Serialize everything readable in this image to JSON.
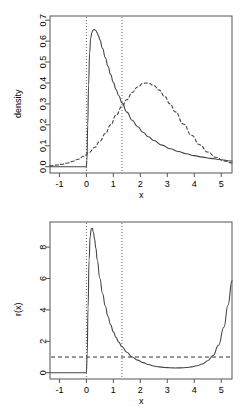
{
  "figure": {
    "type": "multi-panel-plot",
    "background": "#ffffff",
    "foreground": "#000000",
    "panels": 2
  },
  "chart_data": [
    {
      "type": "line",
      "panel": "top",
      "title": "",
      "xlabel": "x",
      "ylabel": "density",
      "xlim": [
        -1.35,
        5.4
      ],
      "ylim": [
        -0.03,
        0.72
      ],
      "xticks": [
        -1,
        0,
        1,
        2,
        3,
        4,
        5
      ],
      "xticklabels": [
        "-1",
        "0",
        "1",
        "2",
        "3",
        "4",
        "5"
      ],
      "yticks": [
        0.0,
        0.1,
        0.2,
        0.3,
        0.4,
        0.5,
        0.6,
        0.7
      ],
      "yticklabels": [
        "0.0",
        "0.1",
        "0.2",
        "0.3",
        "0.4",
        "0.5",
        "0.6",
        "0.7"
      ],
      "grid": false,
      "legend": "none",
      "vlines": [
        {
          "x": 0.0,
          "style": "dotted",
          "color": "#666666"
        },
        {
          "x": 1.32,
          "style": "dotted",
          "color": "#666666"
        }
      ],
      "series": [
        {
          "name": "target density",
          "style": "solid",
          "color": "#444444",
          "x": [
            -1.35,
            -1.2,
            -1.0,
            -0.8,
            -0.6,
            -0.4,
            -0.2,
            -0.05,
            0.0,
            0.02,
            0.05,
            0.08,
            0.12,
            0.16,
            0.2,
            0.25,
            0.3,
            0.35,
            0.4,
            0.45,
            0.5,
            0.6,
            0.7,
            0.8,
            0.9,
            1.0,
            1.1,
            1.2,
            1.32,
            1.5,
            1.7,
            1.9,
            2.1,
            2.3,
            2.5,
            2.8,
            3.1,
            3.4,
            3.7,
            4.0,
            4.3,
            4.6,
            5.0,
            5.4
          ],
          "y": [
            0.0,
            0.0,
            0.0,
            0.0,
            0.0,
            0.0,
            0.0,
            0.0,
            0.0,
            0.03,
            0.2,
            0.39,
            0.545,
            0.615,
            0.64,
            0.653,
            0.655,
            0.651,
            0.64,
            0.625,
            0.606,
            0.565,
            0.522,
            0.48,
            0.44,
            0.403,
            0.369,
            0.339,
            0.305,
            0.261,
            0.222,
            0.191,
            0.165,
            0.143,
            0.125,
            0.103,
            0.086,
            0.073,
            0.062,
            0.053,
            0.046,
            0.04,
            0.033,
            0.027
          ]
        },
        {
          "name": "proposal density",
          "style": "dashed",
          "color": "#444444",
          "x": [
            -1.35,
            -1.1,
            -0.9,
            -0.7,
            -0.5,
            -0.3,
            -0.1,
            0.1,
            0.3,
            0.5,
            0.7,
            0.9,
            1.1,
            1.32,
            1.5,
            1.7,
            1.9,
            2.1,
            2.2,
            2.3,
            2.5,
            2.7,
            2.9,
            3.1,
            3.3,
            3.6,
            3.9,
            4.2,
            4.5,
            4.8,
            5.1,
            5.4
          ],
          "y": [
            0.004,
            0.008,
            0.012,
            0.018,
            0.026,
            0.036,
            0.05,
            0.068,
            0.092,
            0.122,
            0.158,
            0.2,
            0.246,
            0.288,
            0.32,
            0.355,
            0.381,
            0.397,
            0.4,
            0.399,
            0.388,
            0.366,
            0.336,
            0.3,
            0.262,
            0.204,
            0.15,
            0.105,
            0.07,
            0.045,
            0.028,
            0.018
          ]
        }
      ]
    },
    {
      "type": "line",
      "panel": "bottom",
      "title": "",
      "xlabel": "x",
      "ylabel": "r(x)",
      "xlim": [
        -1.35,
        5.4
      ],
      "ylim": [
        -0.4,
        9.6
      ],
      "xticks": [
        -1,
        0,
        1,
        2,
        3,
        4,
        5
      ],
      "xticklabels": [
        "-1",
        "0",
        "1",
        "2",
        "3",
        "4",
        "5"
      ],
      "yticks": [
        0,
        2,
        4,
        6,
        8
      ],
      "yticklabels": [
        "0",
        "2",
        "4",
        "6",
        "8"
      ],
      "grid": false,
      "legend": "none",
      "vlines": [
        {
          "x": 0.0,
          "style": "dotted",
          "color": "#666666"
        },
        {
          "x": 1.32,
          "style": "dotted",
          "color": "#666666"
        }
      ],
      "hlines": [
        {
          "y": 1.0,
          "style": "dashed",
          "color": "#333333"
        }
      ],
      "series": [
        {
          "name": "ratio r(x)",
          "style": "solid",
          "color": "#444444",
          "x": [
            -1.35,
            -1.1,
            -0.8,
            -0.5,
            -0.2,
            -0.02,
            0.0,
            0.03,
            0.06,
            0.1,
            0.14,
            0.18,
            0.22,
            0.26,
            0.3,
            0.35,
            0.4,
            0.5,
            0.6,
            0.7,
            0.8,
            0.9,
            1.0,
            1.1,
            1.2,
            1.32,
            1.5,
            1.7,
            1.9,
            2.1,
            2.3,
            2.5,
            2.7,
            2.9,
            3.1,
            3.3,
            3.5,
            3.7,
            3.9,
            4.1,
            4.3,
            4.5,
            4.7,
            4.9,
            5.1,
            5.25,
            5.4
          ],
          "y": [
            0.0,
            0.0,
            0.0,
            0.0,
            0.0,
            0.0,
            0.0,
            1.2,
            4.1,
            7.2,
            8.7,
            9.15,
            9.2,
            8.95,
            8.55,
            7.95,
            7.2,
            6.0,
            5.05,
            4.25,
            3.6,
            3.05,
            2.6,
            2.25,
            1.95,
            1.65,
            1.3,
            1.0,
            0.8,
            0.64,
            0.52,
            0.43,
            0.375,
            0.335,
            0.315,
            0.305,
            0.31,
            0.33,
            0.37,
            0.44,
            0.56,
            0.76,
            1.1,
            1.75,
            2.9,
            4.3,
            5.85
          ]
        }
      ]
    }
  ],
  "top_panel": {
    "ylabel": "density",
    "xlabel": "x",
    "yticklabels": [
      "0.0",
      "0.1",
      "0.2",
      "0.3",
      "0.4",
      "0.5",
      "0.6",
      "0.7"
    ],
    "xticklabels": [
      "-1",
      "0",
      "1",
      "2",
      "3",
      "4",
      "5"
    ]
  },
  "bottom_panel": {
    "ylabel": "r(x)",
    "xlabel": "x",
    "yticklabels": [
      "0",
      "2",
      "4",
      "6",
      "8"
    ],
    "xticklabels": [
      "-1",
      "0",
      "1",
      "2",
      "3",
      "4",
      "5"
    ]
  }
}
